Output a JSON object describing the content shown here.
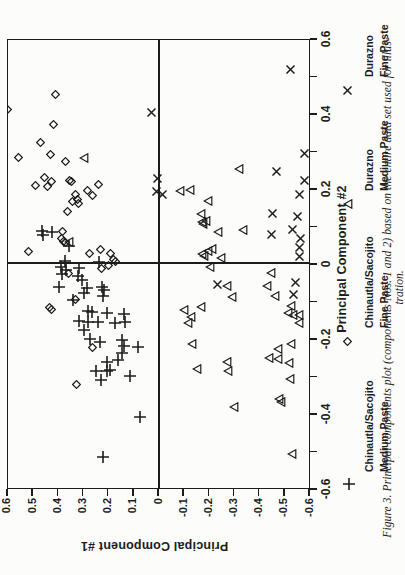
{
  "figure": {
    "caption_line1": "Figure 3.  Principal components plot (components Nos. 1 and 2) based on the entire data set used for illus-",
    "caption_line2": "tration."
  },
  "colors": {
    "ink": "#1c1c1c",
    "paper": "#fcfcfa"
  },
  "legend": {
    "items": [
      {
        "symbol": "plus",
        "line1": "Chinautla/Sacojito",
        "line2": "Medium Paste"
      },
      {
        "symbol": "diamond",
        "line1": "Chinautla/Sacojito",
        "line2": "Fine Paste"
      },
      {
        "symbol": "triangle",
        "line1": "Durazno",
        "line2": "Medium Paste"
      },
      {
        "symbol": "cross",
        "line1": "Durazno",
        "line2": "Fine Paste"
      }
    ]
  },
  "chart_data": {
    "type": "scatter",
    "title": "",
    "xlabel": "Principal Component #2",
    "ylabel": "Principal Component #1",
    "xlim": [
      -0.6,
      0.6
    ],
    "ylim": [
      -0.6,
      0.6
    ],
    "grid": false,
    "page_rotation_deg": -90,
    "x_tick_labels": [
      "-0.6",
      "-0.4",
      "-0.2",
      "0",
      "0.2",
      "0.4",
      "0.6"
    ],
    "x_tick_values": [
      -0.6,
      -0.4,
      -0.2,
      0,
      0.2,
      0.4,
      0.6
    ],
    "x_minor_tick_step": 0.1,
    "y_tick_labels": [
      "0.6",
      "0.5",
      "0.4",
      "0.3",
      "0.2",
      "0.1",
      "0",
      "-0.1",
      "-0.2",
      "-0.3",
      "-0.4",
      "-0.5",
      "-0.6"
    ],
    "y_tick_values": [
      0.6,
      0.5,
      0.4,
      0.3,
      0.2,
      0.1,
      0,
      -0.1,
      -0.2,
      -0.3,
      -0.4,
      -0.5,
      -0.6
    ],
    "legend_position": "bottom",
    "series": [
      {
        "name": "Chinautla/Sacojito Medium Paste",
        "marker": "plus",
        "points": [
          [
            0.085,
            0.465
          ],
          [
            0.075,
            0.46
          ],
          [
            0.083,
            0.425
          ],
          [
            0.045,
            0.356
          ],
          [
            0.004,
            0.372
          ],
          [
            0.003,
            0.24
          ],
          [
            -0.011,
            0.389
          ],
          [
            -0.013,
            0.317
          ],
          [
            -0.018,
            0.371
          ],
          [
            -0.03,
            0.387
          ],
          [
            -0.036,
            0.323
          ],
          [
            -0.045,
            0.307
          ],
          [
            -0.064,
            0.397
          ],
          [
            -0.066,
            0.287
          ],
          [
            -0.064,
            0.228
          ],
          [
            -0.072,
            0.217
          ],
          [
            -0.081,
            0.297
          ],
          [
            -0.087,
            0.221
          ],
          [
            -0.099,
            0.34
          ],
          [
            -0.129,
            0.283
          ],
          [
            -0.132,
            0.265
          ],
          [
            -0.134,
            0.208
          ],
          [
            -0.136,
            0.138
          ],
          [
            -0.154,
            0.318
          ],
          [
            -0.158,
            0.283
          ],
          [
            -0.157,
            0.244
          ],
          [
            -0.161,
            0.175
          ],
          [
            -0.158,
            0.135
          ],
          [
            -0.179,
            0.297
          ],
          [
            -0.203,
            0.274
          ],
          [
            -0.212,
            0.234
          ],
          [
            -0.206,
            0.146
          ],
          [
            -0.221,
            0.138
          ],
          [
            -0.239,
            0.146
          ],
          [
            -0.224,
            0.085
          ],
          [
            -0.263,
            0.208
          ],
          [
            -0.26,
            0.164
          ],
          [
            -0.288,
            0.251
          ],
          [
            -0.288,
            0.208
          ],
          [
            -0.285,
            0.195
          ],
          [
            -0.312,
            0.23
          ],
          [
            -0.302,
            0.115
          ],
          [
            -0.412,
            0.075
          ],
          [
            -0.518,
            0.221
          ]
        ]
      },
      {
        "name": "Chinautla/Sacojito Fine Paste",
        "marker": "diamond",
        "points": [
          [
            0.45,
            0.41
          ],
          [
            0.41,
            0.6
          ],
          [
            0.37,
            0.42
          ],
          [
            0.32,
            0.47
          ],
          [
            0.29,
            0.43
          ],
          [
            0.28,
            0.56
          ],
          [
            0.27,
            0.37
          ],
          [
            0.227,
            0.456
          ],
          [
            0.216,
            0.429
          ],
          [
            0.207,
            0.489
          ],
          [
            0.203,
            0.442
          ],
          [
            0.22,
            0.356
          ],
          [
            0.216,
            0.346
          ],
          [
            0.194,
            0.283
          ],
          [
            0.209,
            0.24
          ],
          [
            0.181,
            0.263
          ],
          [
            0.182,
            0.333
          ],
          [
            0.17,
            0.323
          ],
          [
            0.163,
            0.343
          ],
          [
            0.158,
            0.319
          ],
          [
            0.136,
            0.363
          ],
          [
            0.085,
            0.385
          ],
          [
            0.065,
            0.387
          ],
          [
            0.058,
            0.38
          ],
          [
            0.054,
            0.37
          ],
          [
            0.031,
            0.518
          ],
          [
            0.025,
            0.277
          ],
          [
            0.037,
            0.234
          ],
          [
            0.025,
            0.191
          ],
          [
            0.01,
            0.182
          ],
          [
            0.004,
            0.171
          ],
          [
            -0.006,
            0.2
          ],
          [
            -0.015,
            0.228
          ],
          [
            -0.027,
            0.358
          ],
          [
            -0.118,
            0.437
          ],
          [
            -0.125,
            0.426
          ],
          [
            -0.097,
            0.331
          ],
          [
            -0.225,
            0.263
          ],
          [
            -0.324,
            0.327
          ]
        ]
      },
      {
        "name": "Durazno Medium Paste",
        "marker": "triangle",
        "points": [
          [
            0.28,
            0.297
          ],
          [
            0.251,
            -0.318
          ],
          [
            0.193,
            -0.083
          ],
          [
            0.195,
            -0.123
          ],
          [
            0.164,
            -0.196
          ],
          [
            0.131,
            -0.167
          ],
          [
            0.11,
            -0.17
          ],
          [
            0.112,
            -0.186
          ],
          [
            0.104,
            -0.174
          ],
          [
            0.083,
            -0.233
          ],
          [
            0.089,
            -0.335
          ],
          [
            0.056,
            0.359
          ],
          [
            0.023,
            -0.172
          ],
          [
            0.018,
            -0.179
          ],
          [
            0.031,
            -0.193
          ],
          [
            0.038,
            -0.212
          ],
          [
            0.014,
            -0.246
          ],
          [
            -0.01,
            -0.203
          ],
          [
            -0.026,
            -0.445
          ],
          [
            -0.062,
            -0.269
          ],
          [
            -0.091,
            -0.291
          ],
          [
            -0.062,
            -0.428
          ],
          [
            -0.087,
            -0.461
          ],
          [
            -0.125,
            -0.101
          ],
          [
            -0.118,
            -0.167
          ],
          [
            -0.143,
            -0.127
          ],
          [
            -0.161,
            -0.114
          ],
          [
            -0.116,
            -0.524
          ],
          [
            -0.134,
            -0.514
          ],
          [
            -0.138,
            -0.534
          ],
          [
            -0.138,
            -0.556
          ],
          [
            -0.161,
            -0.556
          ],
          [
            -0.217,
            -0.132
          ],
          [
            -0.23,
            -0.472
          ],
          [
            -0.215,
            -0.524
          ],
          [
            -0.254,
            -0.437
          ],
          [
            -0.257,
            -0.474
          ],
          [
            -0.266,
            -0.517
          ],
          [
            -0.263,
            -0.269
          ],
          [
            -0.288,
            -0.273
          ],
          [
            -0.284,
            -0.15
          ],
          [
            -0.31,
            -0.52
          ],
          [
            -0.362,
            -0.477
          ],
          [
            -0.37,
            -0.486
          ],
          [
            -0.385,
            -0.299
          ],
          [
            -0.51,
            -0.53
          ]
        ]
      },
      {
        "name": "Durazno Fine Paste",
        "marker": "cross",
        "points": [
          [
            0.517,
            -0.524
          ],
          [
            0.4,
            0.028
          ],
          [
            0.292,
            -0.577
          ],
          [
            0.244,
            -0.465
          ],
          [
            0.22,
            -0.577
          ],
          [
            0.224,
            0.005
          ],
          [
            0.191,
            0.009
          ],
          [
            0.182,
            -0.012
          ],
          [
            0.182,
            -0.56
          ],
          [
            0.132,
            -0.45
          ],
          [
            0.123,
            -0.551
          ],
          [
            0.088,
            -0.53
          ],
          [
            0.076,
            -0.448
          ],
          [
            0.065,
            -0.564
          ],
          [
            0.041,
            -0.56
          ],
          [
            0.016,
            -0.56
          ],
          [
            -0.057,
            -0.233
          ],
          [
            -0.051,
            -0.543
          ],
          [
            -0.084,
            -0.534
          ]
        ]
      }
    ]
  }
}
